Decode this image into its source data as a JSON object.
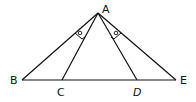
{
  "diagram": {
    "type": "geometry",
    "points": {
      "A": {
        "label": "A",
        "x": 98,
        "y": 13
      },
      "B": {
        "label": "B",
        "x": 22,
        "y": 80
      },
      "C": {
        "label": "C",
        "x": 62,
        "y": 80
      },
      "D": {
        "label": "D",
        "x": 137,
        "y": 80
      },
      "E": {
        "label": "E",
        "x": 176,
        "y": 80
      }
    },
    "segments": [
      [
        "A",
        "B"
      ],
      [
        "A",
        "C"
      ],
      [
        "A",
        "D"
      ],
      [
        "A",
        "E"
      ],
      [
        "B",
        "E"
      ]
    ],
    "angle_marks": [
      {
        "between": [
          "AB",
          "AC"
        ],
        "symbol": "o"
      },
      {
        "between": [
          "AD",
          "AE"
        ],
        "symbol": "o"
      }
    ],
    "stroke_color": "#111111"
  }
}
